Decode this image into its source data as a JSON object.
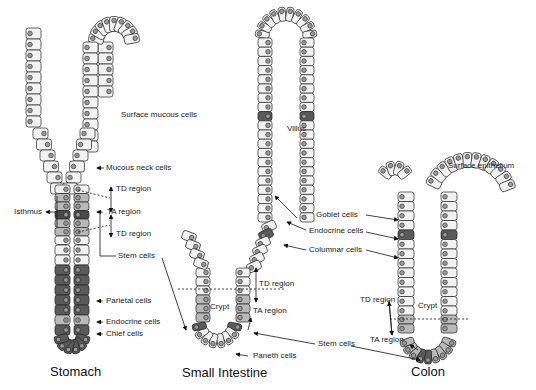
{
  "colors": {
    "light_cell": "#f2f2f2",
    "mid_cell": "#b9b9b9",
    "dark_cell": "#5a5a5a",
    "darker_cell": "#4a4a4a",
    "nucleus": "#9a9a9a",
    "outline": "#222222"
  },
  "stomach": {
    "title": "Stomach",
    "labels": {
      "surface_mucous": "Surface mucous cells",
      "mucous_neck": "Mucous neck cells",
      "td_region_upper": "TD region",
      "ta_region": "TA region",
      "td_region_lower": "TD region",
      "isthmus": "Isthmus",
      "stem_cells": "Stem cells",
      "parietal": "Parietal cells",
      "endocrine": "Endocrine cells",
      "chief": "Chief cells"
    }
  },
  "small_intestine": {
    "title": "Small Intestine",
    "labels": {
      "villus": "Villus",
      "goblet": "Goblet cells",
      "endocrine": "Endocrine cells",
      "columnar": "Columnar cells",
      "td_region": "TD region",
      "crypt": "Crypt",
      "ta_region": "TA region",
      "stem_cells": "Stem cells",
      "paneth": "Paneth cells"
    }
  },
  "colon": {
    "title": "Colon",
    "labels": {
      "surface_epithelium": "Surface epithelium",
      "td_region": "TD region",
      "crypt": "Crypt",
      "ta_region": "TA region"
    }
  }
}
